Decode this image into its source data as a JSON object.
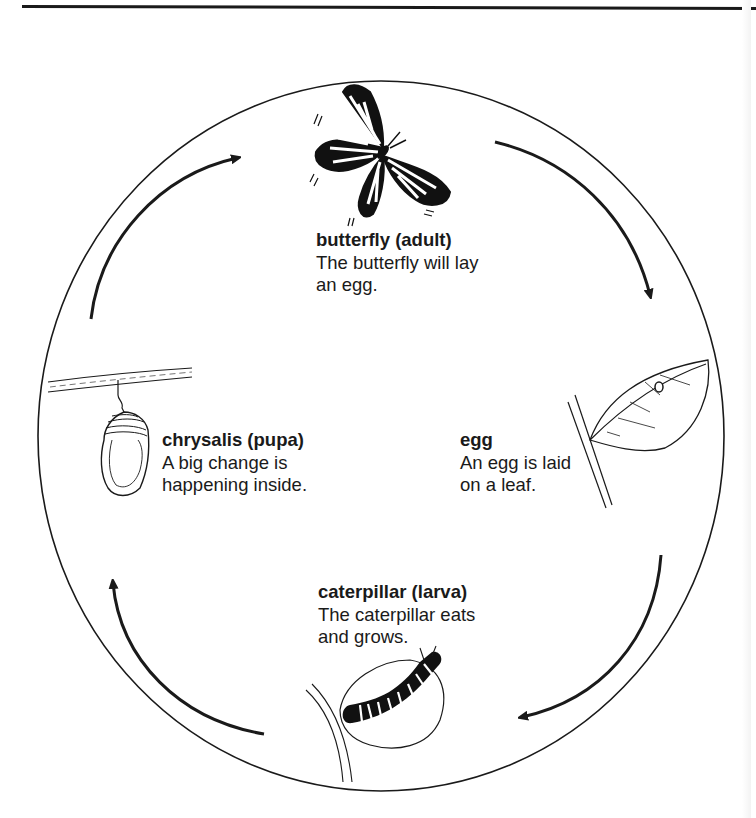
{
  "diagram": {
    "type": "life-cycle",
    "subject": "butterfly",
    "direction": "clockwise",
    "colors": {
      "ink": "#1a1a1a",
      "background": "#ffffff"
    },
    "stages": [
      {
        "id": "adult",
        "title": "butterfly (adult)",
        "desc_line1": "The butterfly will lay",
        "desc_line2": "an egg.",
        "icon": "butterfly-icon"
      },
      {
        "id": "egg",
        "title": "egg",
        "desc_line1": "An egg is laid",
        "desc_line2": "on a leaf.",
        "icon": "egg-on-leaf-icon"
      },
      {
        "id": "larva",
        "title": "caterpillar (larva)",
        "desc_line1": "The caterpillar eats",
        "desc_line2": "and grows.",
        "icon": "caterpillar-icon"
      },
      {
        "id": "pupa",
        "title": "chrysalis (pupa)",
        "desc_line1": "A big change is",
        "desc_line2": "happening inside.",
        "icon": "chrysalis-icon"
      }
    ],
    "arrows": [
      {
        "from": "adult",
        "to": "egg"
      },
      {
        "from": "egg",
        "to": "larva"
      },
      {
        "from": "larva",
        "to": "pupa"
      },
      {
        "from": "pupa",
        "to": "adult"
      }
    ]
  }
}
